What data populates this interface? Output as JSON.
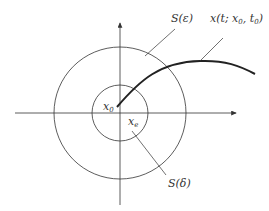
{
  "diagram": {
    "labels": {
      "outer_sphere": "S(ε)",
      "inner_sphere": "S(δ)",
      "trajectory_main": "x(t; x",
      "trajectory_sub1": "0",
      "trajectory_mid": ", t",
      "trajectory_sub2": "0",
      "trajectory_end": ")",
      "x0_main": "x",
      "x0_sub": "0",
      "xe_main": "x",
      "xe_sub": "e"
    },
    "colors": {
      "stroke": "#333333",
      "trajectory": "#222222",
      "background": "#ffffff"
    }
  }
}
